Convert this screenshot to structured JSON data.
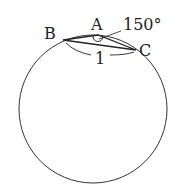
{
  "diagram": {
    "type": "geometry",
    "points": {
      "A": {
        "label": "A",
        "x": 98,
        "y": 35
      },
      "B": {
        "label": "B",
        "x": 63,
        "y": 40
      },
      "C": {
        "label": "C",
        "x": 136,
        "y": 50
      }
    },
    "circle": {
      "cx": 93,
      "cy": 109,
      "r": 74
    },
    "angle_label": "150°",
    "side_label": "1",
    "colors": {
      "stroke": "#333333",
      "text": "#222222"
    }
  }
}
